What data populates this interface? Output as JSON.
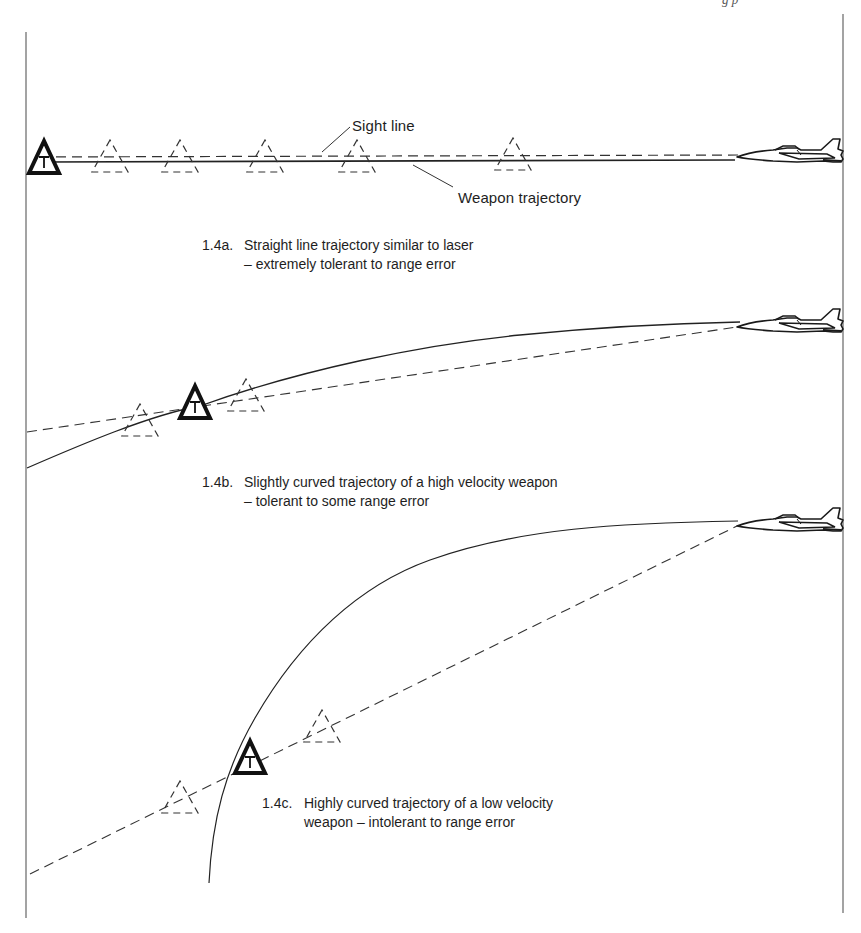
{
  "page": {
    "header_fragment": "g          p"
  },
  "labels": {
    "sight_line": "Sight line",
    "weapon_trajectory": "Weapon trajectory"
  },
  "figures": [
    {
      "id": "1.4a",
      "number": "1.4a.",
      "caption_line1": "Straight line trajectory similar to laser",
      "caption_line2": "– extremely tolerant to range error",
      "trajectory": "straight",
      "ghost_target_count": 5
    },
    {
      "id": "1.4b",
      "number": "1.4b.",
      "caption_line1": "Slightly curved trajectory of a high velocity weapon",
      "caption_line2": "– tolerant to some range error",
      "trajectory": "slightly-curved",
      "ghost_target_count": 2
    },
    {
      "id": "1.4c",
      "number": "1.4c.",
      "caption_line1": "Highly curved trajectory of a low velocity",
      "caption_line2": "weapon – intolerant to range error",
      "trajectory": "highly-curved",
      "ghost_target_count": 2
    }
  ],
  "symbols": {
    "target_letter": "T",
    "target_icon": "triangle-target-icon",
    "ghost_target_icon": "dashed-triangle-icon",
    "aircraft_icon": "jet-aircraft-icon"
  },
  "colors": {
    "ink": "#1a1a1a",
    "line": "#333333",
    "frame": "#555555",
    "background": "#ffffff"
  }
}
